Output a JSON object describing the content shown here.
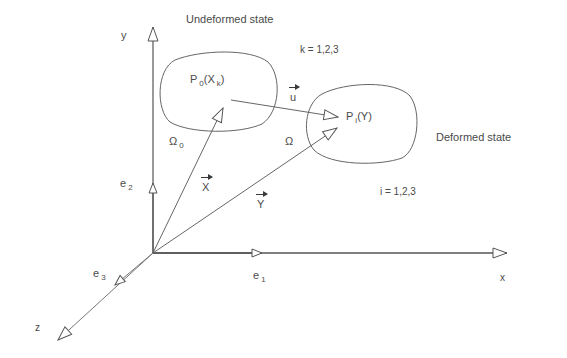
{
  "diagram": {
    "titles": {
      "undeformed": "Undeformed state",
      "deformed": "Deformed state"
    },
    "index_ranges": {
      "k": "k = 1,2,3",
      "i": "i = 1,2,3"
    },
    "axes": {
      "x": "x",
      "y": "y",
      "z": "z"
    },
    "basis_vectors": {
      "e1": {
        "base": "e",
        "sub": "1"
      },
      "e2": {
        "base": "e",
        "sub": "2"
      },
      "e3": {
        "base": "e",
        "sub": "3"
      }
    },
    "regions": {
      "omega0": {
        "base": "Ω",
        "sub": "0"
      },
      "omega": {
        "base": "Ω"
      }
    },
    "points": {
      "p0": {
        "base": "P",
        "sub": "0",
        "arg_open": "(X",
        "arg_sub": "k",
        "arg_close": ")"
      },
      "pi": {
        "base": "P",
        "sub": "i",
        "arg": "(Y)"
      }
    },
    "vectors": {
      "X": "X",
      "Y": "Y",
      "u": "u"
    },
    "colors": {
      "stroke": "#555555",
      "text": "#4a4a4a",
      "background": "#ffffff"
    }
  }
}
